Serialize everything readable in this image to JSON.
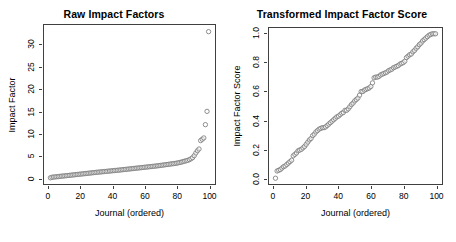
{
  "figure": {
    "background": "#ffffff",
    "marker_stroke": "#808080",
    "marker_fill": "#ffffff",
    "axis_color": "#404040"
  },
  "chart_data": [
    {
      "type": "scatter",
      "panel": "left",
      "title": "Raw Impact Factors",
      "xlabel": "Journal (ordered)",
      "ylabel": "Impact Factor",
      "xlim": [
        -3,
        104
      ],
      "ylim": [
        -1.4,
        34.5
      ],
      "xticks": [
        0,
        20,
        40,
        60,
        80,
        100
      ],
      "xticklabels": [
        "0",
        "20",
        "40",
        "60",
        "80",
        "100"
      ],
      "yticks": [
        0,
        5,
        10,
        15,
        20,
        25,
        30
      ],
      "yticklabels": [
        "0",
        "5",
        "10",
        "15",
        "20",
        "25",
        "30"
      ],
      "grid": false,
      "legend": "none",
      "marker": "open-circle",
      "x": [
        1,
        2,
        3,
        4,
        5,
        6,
        7,
        8,
        9,
        10,
        11,
        12,
        13,
        14,
        15,
        16,
        17,
        18,
        19,
        20,
        21,
        22,
        23,
        24,
        25,
        26,
        27,
        28,
        29,
        30,
        31,
        32,
        33,
        34,
        35,
        36,
        37,
        38,
        39,
        40,
        41,
        42,
        43,
        44,
        45,
        46,
        47,
        48,
        49,
        50,
        51,
        52,
        53,
        54,
        55,
        56,
        57,
        58,
        59,
        60,
        61,
        62,
        63,
        64,
        65,
        66,
        67,
        68,
        69,
        70,
        71,
        72,
        73,
        74,
        75,
        76,
        77,
        78,
        79,
        80,
        81,
        82,
        83,
        84,
        85,
        86,
        87,
        88,
        89,
        90,
        91,
        92,
        93,
        94,
        95,
        96,
        97,
        98,
        99,
        100
      ],
      "y": [
        0.0,
        0.12,
        0.17,
        0.2,
        0.24,
        0.28,
        0.33,
        0.37,
        0.4,
        0.44,
        0.48,
        0.52,
        0.56,
        0.6,
        0.64,
        0.68,
        0.72,
        0.76,
        0.8,
        0.84,
        0.88,
        0.92,
        0.96,
        1.0,
        1.04,
        1.08,
        1.12,
        1.16,
        1.2,
        1.24,
        1.28,
        1.31,
        1.35,
        1.38,
        1.42,
        1.45,
        1.49,
        1.52,
        1.56,
        1.6,
        1.63,
        1.67,
        1.7,
        1.74,
        1.78,
        1.82,
        1.86,
        1.9,
        1.94,
        1.98,
        2.02,
        2.06,
        2.1,
        2.14,
        2.18,
        2.22,
        2.26,
        2.3,
        2.34,
        2.38,
        2.42,
        2.46,
        2.5,
        2.54,
        2.58,
        2.62,
        2.66,
        2.7,
        2.75,
        2.8,
        2.85,
        2.9,
        2.95,
        3.0,
        3.05,
        3.1,
        3.15,
        3.2,
        3.25,
        3.3,
        3.38,
        3.46,
        3.55,
        3.65,
        3.75,
        3.85,
        3.95,
        4.1,
        4.3,
        4.55,
        5.0,
        5.6,
        6.1,
        6.5,
        8.4,
        8.7,
        9.0,
        12.0,
        15.0,
        33.0
      ]
    },
    {
      "type": "scatter",
      "panel": "right",
      "title": "Transformed Impact Factor Score",
      "xlabel": "Journal (ordered)",
      "ylabel": "Impact Factor Score",
      "xlim": [
        -3,
        104
      ],
      "ylim": [
        -0.04,
        1.04
      ],
      "xticks": [
        0,
        20,
        40,
        60,
        80,
        100
      ],
      "xticklabels": [
        "0",
        "20",
        "40",
        "60",
        "80",
        "100"
      ],
      "yticks": [
        0.0,
        0.2,
        0.4,
        0.6,
        0.8,
        1.0
      ],
      "yticklabels": [
        "0.0",
        "0.2",
        "0.4",
        "0.6",
        "0.8",
        "1.0"
      ],
      "grid": false,
      "legend": "none",
      "marker": "open-circle",
      "x": [
        1,
        2,
        3,
        4,
        5,
        6,
        7,
        8,
        9,
        10,
        11,
        12,
        13,
        14,
        15,
        16,
        17,
        18,
        19,
        20,
        21,
        22,
        23,
        24,
        25,
        26,
        27,
        28,
        29,
        30,
        31,
        32,
        33,
        34,
        35,
        36,
        37,
        38,
        39,
        40,
        41,
        42,
        43,
        44,
        45,
        46,
        47,
        48,
        49,
        50,
        51,
        52,
        53,
        54,
        55,
        56,
        57,
        58,
        59,
        60,
        61,
        62,
        63,
        64,
        65,
        66,
        67,
        68,
        69,
        70,
        71,
        72,
        73,
        74,
        75,
        76,
        77,
        78,
        79,
        80,
        81,
        82,
        83,
        84,
        85,
        86,
        87,
        88,
        89,
        90,
        91,
        92,
        93,
        94,
        95,
        96,
        97,
        98,
        99,
        100
      ],
      "y": [
        0.0,
        0.05,
        0.055,
        0.06,
        0.07,
        0.08,
        0.085,
        0.095,
        0.105,
        0.115,
        0.125,
        0.155,
        0.165,
        0.175,
        0.19,
        0.195,
        0.2,
        0.21,
        0.22,
        0.235,
        0.25,
        0.265,
        0.275,
        0.295,
        0.305,
        0.32,
        0.33,
        0.34,
        0.345,
        0.35,
        0.35,
        0.355,
        0.365,
        0.375,
        0.385,
        0.395,
        0.405,
        0.415,
        0.425,
        0.43,
        0.44,
        0.45,
        0.455,
        0.47,
        0.47,
        0.48,
        0.495,
        0.51,
        0.52,
        0.535,
        0.545,
        0.555,
        0.575,
        0.6,
        0.6,
        0.61,
        0.615,
        0.62,
        0.625,
        0.635,
        0.66,
        0.695,
        0.7,
        0.7,
        0.705,
        0.715,
        0.72,
        0.725,
        0.73,
        0.735,
        0.745,
        0.75,
        0.755,
        0.765,
        0.77,
        0.775,
        0.78,
        0.79,
        0.795,
        0.8,
        0.81,
        0.835,
        0.845,
        0.855,
        0.86,
        0.875,
        0.885,
        0.9,
        0.91,
        0.925,
        0.935,
        0.95,
        0.96,
        0.97,
        0.98,
        0.99,
        0.995,
        1.0,
        1.0,
        1.0
      ]
    }
  ]
}
